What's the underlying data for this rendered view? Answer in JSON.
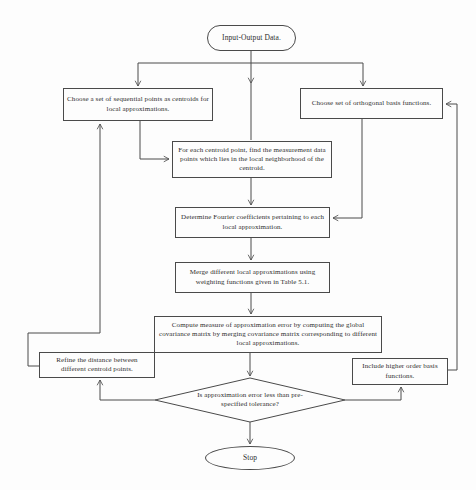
{
  "diagram": {
    "type": "flowchart",
    "background": "#fdfdfd",
    "colors": {
      "line": "#4a4a4a",
      "text": "#2e2e2e",
      "node_fill": "#fdfdfd"
    },
    "nodes": {
      "start": {
        "label": "Input-Output Data.",
        "shape": "terminator"
      },
      "choose_centroids": {
        "label": "Choose a set of sequential points as centroids for local approximations.",
        "shape": "process"
      },
      "choose_basis": {
        "label": "Choose set of orthogonal basis functions.",
        "shape": "process"
      },
      "find_points": {
        "label": "For each centroid point, find the measurement data points which lies in the local neighborhood of the centroid.",
        "shape": "process"
      },
      "fourier": {
        "label": "Determine Fourier coefficients pertaining to each local approximation.",
        "shape": "process"
      },
      "merge": {
        "label": "Merge different local approximations using weighting functions given in Table 5.1.",
        "shape": "process"
      },
      "compute_error": {
        "label": "Compute measure of approximation error by computing the global covariance matrix by merging covariance matrix corresponding to different local approximations.",
        "shape": "process"
      },
      "refine": {
        "label": "Refine the distance between different centroid points.",
        "shape": "process"
      },
      "higher_order": {
        "label": "Include higher order basis functions.",
        "shape": "process"
      },
      "decision": {
        "label": "Is approximation error less than pre-specified tolerance?",
        "shape": "decision"
      },
      "stop": {
        "label": "Stop",
        "shape": "terminator"
      }
    },
    "edges": [
      {
        "from": "start",
        "to": "choose_centroids"
      },
      {
        "from": "start",
        "to": "find_points"
      },
      {
        "from": "start",
        "to": "choose_basis"
      },
      {
        "from": "choose_centroids",
        "to": "find_points"
      },
      {
        "from": "choose_basis",
        "to": "fourier"
      },
      {
        "from": "find_points",
        "to": "fourier"
      },
      {
        "from": "fourier",
        "to": "merge"
      },
      {
        "from": "merge",
        "to": "compute_error"
      },
      {
        "from": "compute_error",
        "to": "decision"
      },
      {
        "from": "decision",
        "to": "refine"
      },
      {
        "from": "decision",
        "to": "higher_order"
      },
      {
        "from": "decision",
        "to": "stop"
      },
      {
        "from": "refine",
        "to": "choose_centroids"
      },
      {
        "from": "higher_order",
        "to": "choose_basis"
      }
    ]
  }
}
